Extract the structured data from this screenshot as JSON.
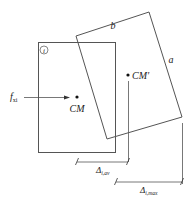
{
  "diagram": {
    "labels": {
      "story_index": "i",
      "side_b": "b",
      "side_a": "a",
      "force": "f",
      "force_sub": "xi",
      "cm": "CM",
      "cm_prime": "CM′",
      "delta_av": "Δ",
      "delta_av_sub": "i,av",
      "delta_max": "Δ",
      "delta_max_sub": "i,max"
    },
    "colors": {
      "stroke": "#555555",
      "text": "#222222"
    }
  }
}
